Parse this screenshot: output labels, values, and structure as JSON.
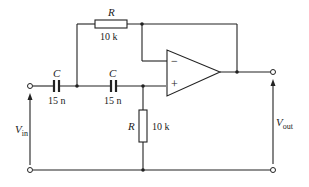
{
  "circuit": {
    "title": "Sallen-Key high-pass filter",
    "components": {
      "r_feedback": {
        "symbol": "R",
        "value": "10 k"
      },
      "r_ground": {
        "symbol": "R",
        "value": "10 k"
      },
      "c1": {
        "symbol": "C",
        "value": "15 n"
      },
      "c2": {
        "symbol": "C",
        "value": "15 n"
      },
      "opamp": {
        "minus": "−",
        "plus": "+"
      }
    },
    "terminals": {
      "vin": {
        "main": "V",
        "sub": "in"
      },
      "vout": {
        "main": "V",
        "sub": "out"
      }
    },
    "colors": {
      "line": "#222222",
      "background": "#ffffff"
    }
  }
}
